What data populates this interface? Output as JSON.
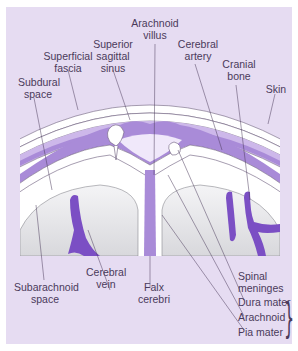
{
  "diagram": {
    "colors": {
      "background": "#e6dcf2",
      "membrane": "#a98bd8",
      "vessel": "#7b4fc4",
      "brain": "#e2e2e4",
      "layer_white": "#ffffff",
      "line": "#4a3a5a"
    },
    "labels": {
      "arachnoid_villus": [
        "Arachnoid",
        "villus"
      ],
      "superior_sagittal_sinus": [
        "Superior",
        "sagittal",
        "sinus"
      ],
      "superficial_fascia": [
        "Superficial",
        "fascia"
      ],
      "cerebral_artery": [
        "Cerebral",
        "artery"
      ],
      "cranial_bone": [
        "Cranial",
        "bone"
      ],
      "subdural_space": [
        "Subdural",
        "space"
      ],
      "skin": "Skin",
      "subarachnoid_space": [
        "Subarachnoid",
        "space"
      ],
      "cerebral_vein": [
        "Cerebral",
        "vein"
      ],
      "falx_cerebri": [
        "Falx",
        "cerebri"
      ],
      "spinal_meninges": [
        "Spinal",
        "meninges"
      ],
      "dura_mater": "Dura mater",
      "arachnoid": "Arachnoid",
      "pia_mater": "Pia mater"
    },
    "brace_group": [
      "Dura mater",
      "Arachnoid",
      "Pia mater"
    ]
  }
}
